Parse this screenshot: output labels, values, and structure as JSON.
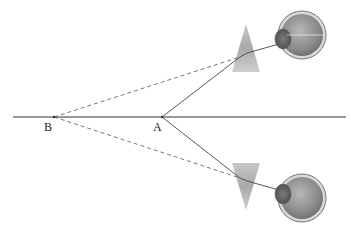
{
  "diagram": {
    "points": [
      {
        "id": "B",
        "label": "B"
      },
      {
        "id": "A",
        "label": "A"
      }
    ],
    "elements": [
      "horizontal-axis",
      "top-prism",
      "bottom-prism",
      "top-eye",
      "bottom-eye",
      "real-rays",
      "virtual-rays"
    ],
    "colors": {
      "line": "#333333",
      "dashed": "#555555",
      "prism": "#b8b8b8",
      "eye": "#8a8a8a"
    }
  }
}
